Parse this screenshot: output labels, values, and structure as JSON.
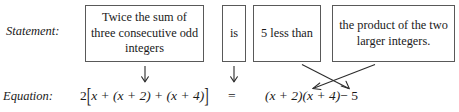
{
  "labels": {
    "statement": "Statement:",
    "equation": "Equation:"
  },
  "statement_boxes": [
    {
      "name": "box-sum",
      "text": "Twice the sum of three consecutive odd integers"
    },
    {
      "name": "box-is",
      "text": "is"
    },
    {
      "name": "box-less",
      "text": "5 less than"
    },
    {
      "name": "box-product",
      "text": "the product of the two larger integers."
    }
  ],
  "equation": {
    "left": "2[x + (x + 2) + (x + 4)]",
    "left_coefficient": "2",
    "left_bracket_open": "[",
    "left_inner": "x + (x + 2) + (x + 4)",
    "left_bracket_close": "]",
    "equals": "=",
    "right": "(x + 2)(x + 4) − 5",
    "right_factor_one": "(x + 2)",
    "right_factor_two": "(x + 4)",
    "right_minus": "− 5"
  },
  "arrows": {
    "down_arrow_left": "down-arrow",
    "down_arrow_is": "down-arrow",
    "cross_arrow_product_to_factors": "diagonal-arrow-down-left",
    "cross_arrow_less_to_minus": "diagonal-arrow-down-right"
  },
  "colors": {
    "background": "#ffffff",
    "text": "#1a1a1a",
    "box_border": "#595959",
    "arrow": "#2b2b2b"
  }
}
